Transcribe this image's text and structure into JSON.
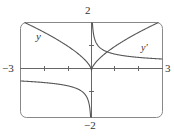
{
  "chart_data": {
    "type": "line",
    "title": "",
    "xlabel": "",
    "ylabel": "",
    "xlim": [
      -3,
      3
    ],
    "ylim": [
      -2,
      2
    ],
    "grid": false,
    "tick_labels": {
      "x_min": "−3",
      "x_max": "3",
      "y_max": "2",
      "y_min": "−2"
    },
    "series": [
      {
        "name": "y",
        "label": "y",
        "formula": "x^(2/3)",
        "x": [
          -3,
          -2,
          -1,
          -0.5,
          0,
          0.5,
          1,
          2,
          3
        ],
        "values": [
          2.08,
          1.59,
          1.0,
          0.63,
          0,
          0.63,
          1.0,
          1.59,
          2.08
        ]
      },
      {
        "name": "y'",
        "label": "y′",
        "formula": "(2/3)x^(-1/3)",
        "x": [
          -3,
          -2,
          -1,
          -0.5,
          -0.1,
          0.1,
          0.5,
          1,
          2,
          3
        ],
        "values": [
          -0.46,
          -0.53,
          -0.67,
          -0.84,
          -1.44,
          1.44,
          0.84,
          0.67,
          0.53,
          0.46
        ]
      }
    ],
    "legend": "inline labels"
  }
}
